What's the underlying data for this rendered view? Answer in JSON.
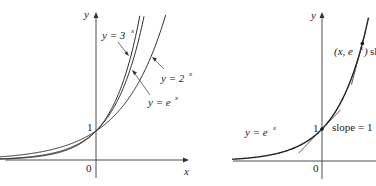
{
  "chart_data": [
    {
      "type": "line",
      "panel": "left",
      "title": "",
      "xlabel": "x",
      "ylabel": "y",
      "xlim": [
        -3.2,
        3.0
      ],
      "ylim": [
        -0.6,
        5.0
      ],
      "grid": false,
      "tick_labels": {
        "origin": "0",
        "y_one": "1"
      },
      "series": [
        {
          "name": "y = 3^x",
          "base": 3,
          "label_main": "y = 3",
          "label_sup": "x"
        },
        {
          "name": "y = e^x",
          "base": 2.718281828,
          "label_main": "y = e",
          "label_sup": "x"
        },
        {
          "name": "y = 2^x",
          "base": 2,
          "label_main": "y = 2",
          "label_sup": "x"
        }
      ]
    },
    {
      "type": "line",
      "panel": "right",
      "title": "",
      "xlabel": "x",
      "ylabel": "y",
      "xlim": [
        -2.9,
        1.7
      ],
      "ylim": [
        -0.6,
        4.5
      ],
      "grid": false,
      "tick_labels": {
        "origin": "0",
        "y_one": "1"
      },
      "series": [
        {
          "name": "y = e^x",
          "base": 2.718281828,
          "label_main": "y = e",
          "label_sup": "x"
        }
      ],
      "annotations": [
        {
          "text": "slope = 1",
          "at": [
            0,
            1
          ],
          "type": "tangent-point"
        },
        {
          "text_main": "(x, e",
          "text_sup": "x",
          "text_close": ")",
          "at": [
            1.3,
            3.67
          ],
          "type": "point",
          "note": "sl"
        }
      ]
    }
  ]
}
